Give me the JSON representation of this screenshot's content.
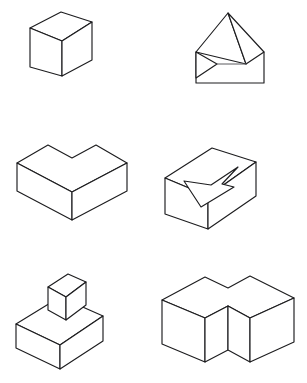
{
  "page": {
    "background_color": "#ffffff",
    "line_color": "#1d1d1f",
    "fill_color": "#ffffff",
    "width": 307,
    "height": 383,
    "caption": ""
  },
  "layout": {
    "columns": 2,
    "rows": 3,
    "cell_width": 153,
    "cell_height": 127
  },
  "figures": [
    {
      "id": "figure-1",
      "position": "top-left",
      "name": "cube",
      "label": "Cube",
      "description": "A single cube drawn in isometric projection showing top, left and right faces."
    },
    {
      "id": "figure-2",
      "position": "top-right",
      "name": "open-envelope-prism",
      "label": "Open envelope prism",
      "description": "A rectangular panel with a large triangular flap folded up and a smaller triangular flap at the left."
    },
    {
      "id": "figure-3",
      "position": "middle-left",
      "name": "chevron-slab",
      "label": "Chevron slab",
      "description": "A low L-shaped or chevron shaped slab seen from above, notched at the rear centre."
    },
    {
      "id": "figure-4",
      "position": "middle-right",
      "name": "box-with-arrow-notch",
      "label": "Box with arrow notch",
      "description": "A rectangular box whose top face carries an arrow shaped groove pointing to the upper right."
    },
    {
      "id": "figure-5",
      "position": "bottom-left",
      "name": "cube-on-slab",
      "label": "Cube on slab",
      "description": "A small cube resting centrally on top of a larger flat rectangular slab."
    },
    {
      "id": "figure-6",
      "position": "bottom-right",
      "name": "l-shaped-block",
      "label": "L-shaped block",
      "description": "A tall L-shaped prism, the corner pointing towards the viewer."
    }
  ]
}
